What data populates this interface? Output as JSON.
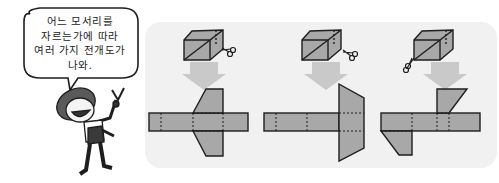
{
  "speech_bubble": {
    "lines": [
      "어느 모서리를",
      "자르는가에 따라",
      "여러 가지 전개도가",
      "나와."
    ]
  },
  "colors": {
    "panel_bg": "#f1f1f1",
    "face_fill": "#a8a8a8",
    "arrow_fill": "#c9c9c9",
    "outline": "#1e1e1e"
  },
  "figures": [
    {
      "name": "net-1",
      "description": "cuboid cut along edges, flaps folded up and down as trapezoids on middle face"
    },
    {
      "name": "net-2",
      "description": "cuboid cut along edges, trapezoid flaps attached at right end"
    },
    {
      "name": "net-3",
      "description": "cuboid cut along edges, flaps attached on different sides"
    }
  ]
}
